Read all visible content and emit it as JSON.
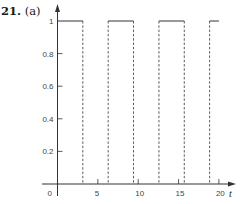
{
  "figure": {
    "problem_number": "21.",
    "part_label": "(a)"
  },
  "chart_data": {
    "type": "line",
    "title": "",
    "xlabel": "t",
    "ylabel": "",
    "xlim": [
      -1.8,
      21.5
    ],
    "ylim": [
      0,
      1.0
    ],
    "x_ticks": [
      0,
      5,
      10,
      15,
      20
    ],
    "x_tick_labels": [
      "0",
      "5",
      "10",
      "15",
      "20"
    ],
    "y_ticks": [
      0.2,
      0.4,
      0.6,
      0.8,
      1
    ],
    "y_tick_labels": [
      "0.2",
      "0.4",
      "0.6",
      "0.8",
      "1"
    ],
    "grid": false,
    "legend": null,
    "series": [
      {
        "name": "square wave",
        "description": "Equals 1 on [2k*pi, (2k+1)*pi], 0 otherwise; vertical jumps drawn dashed",
        "segments_at_1": [
          [
            0,
            3.14
          ],
          [
            6.28,
            9.42
          ],
          [
            12.57,
            15.71
          ],
          [
            18.85,
            20.0
          ]
        ],
        "dashed_verticals_at_t": [
          3.14,
          6.28,
          9.42,
          12.57,
          15.71,
          18.85
        ]
      }
    ],
    "colors": {
      "axis": "#333333",
      "curve": "#333333"
    }
  }
}
